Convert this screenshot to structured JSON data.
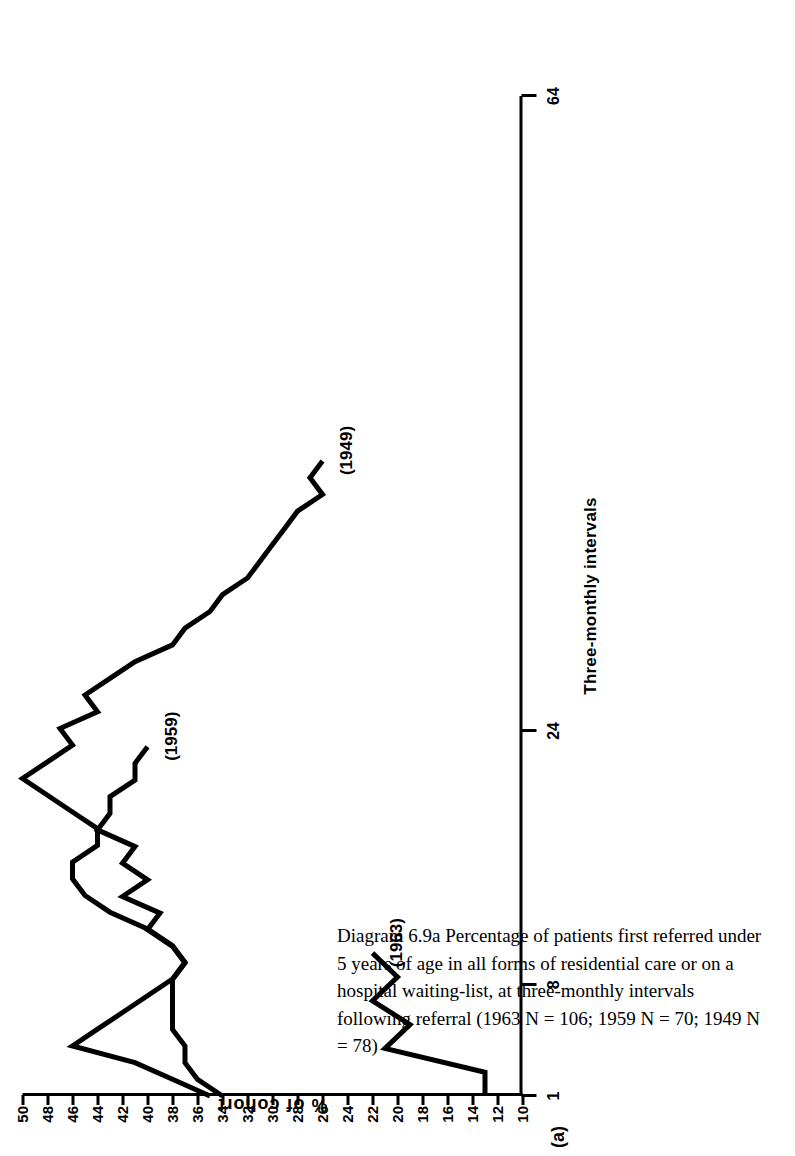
{
  "figure": {
    "panel_letter": "(a)",
    "caption": "Diagram 6.9a   Percentage of patients first referred under 5 years of age in all forms of residential care or on a hospital waiting-list, at three-monthly intervals following referral (1963 N = 106; 1959 N = 70; 1949 N = 78)"
  },
  "chart_data": {
    "type": "line",
    "title": "Diagram 6.9a",
    "orientation": "rotated-90-ccw",
    "xlabel": "Three-monthly intervals",
    "ylabel": "% of cohort",
    "xlim": [
      1,
      64
    ],
    "ylim": [
      10,
      50
    ],
    "x_ticks": [
      1,
      8,
      24,
      64
    ],
    "x_tick_labels": [
      "1",
      "8",
      "24",
      "64"
    ],
    "x_minor_ticks": [
      8,
      24,
      64
    ],
    "y_ticks": [
      10,
      12,
      14,
      16,
      18,
      20,
      22,
      24,
      26,
      28,
      30,
      32,
      34,
      36,
      38,
      40,
      42,
      44,
      46,
      48,
      50
    ],
    "y_tick_labels": [
      "10",
      "12",
      "14",
      "16",
      "18",
      "20",
      "22",
      "24",
      "26",
      "28",
      "30",
      "32",
      "34",
      "36",
      "38",
      "40",
      "42",
      "44",
      "46",
      "48",
      "50"
    ],
    "grid": false,
    "legend": "inline-labels",
    "series": [
      {
        "name": "1963",
        "label": "(1963)",
        "n": 106,
        "x": [
          1,
          2,
          3,
          4,
          5,
          6,
          7
        ],
        "values": [
          13,
          13,
          21,
          19,
          22,
          20,
          22
        ]
      },
      {
        "name": "1959",
        "label": "(1959)",
        "n": 70,
        "x": [
          1,
          2,
          3,
          4,
          5,
          6,
          7,
          8,
          9,
          10,
          11,
          12,
          13,
          14,
          15,
          16,
          17,
          18,
          19,
          20,
          21,
          22
        ],
        "values": [
          34,
          36,
          37,
          37,
          38,
          38,
          38,
          38,
          37,
          38,
          40,
          39,
          42,
          40,
          42,
          41,
          44,
          43,
          43,
          41,
          41,
          40
        ]
      },
      {
        "name": "1949",
        "label": "(1949)",
        "n": 78,
        "x": [
          1,
          2,
          3,
          4,
          5,
          6,
          7,
          8,
          9,
          10,
          11,
          12,
          13,
          14,
          15,
          16,
          17,
          18,
          19,
          20,
          21,
          22,
          23,
          24,
          25,
          26,
          27,
          28,
          29,
          30,
          31,
          32,
          33,
          34,
          35,
          36,
          37,
          38,
          39
        ],
        "values": [
          35,
          38,
          41,
          46,
          44,
          42,
          40,
          38,
          37,
          38,
          40,
          43,
          45,
          46,
          46,
          44,
          44,
          46,
          48,
          50,
          48,
          46,
          47,
          44,
          45,
          43,
          41,
          38,
          37,
          35,
          34,
          32,
          31,
          30,
          29,
          28,
          26,
          27,
          26
        ]
      }
    ]
  },
  "colors": {
    "ink": "#000000",
    "paper": "#ffffff"
  }
}
